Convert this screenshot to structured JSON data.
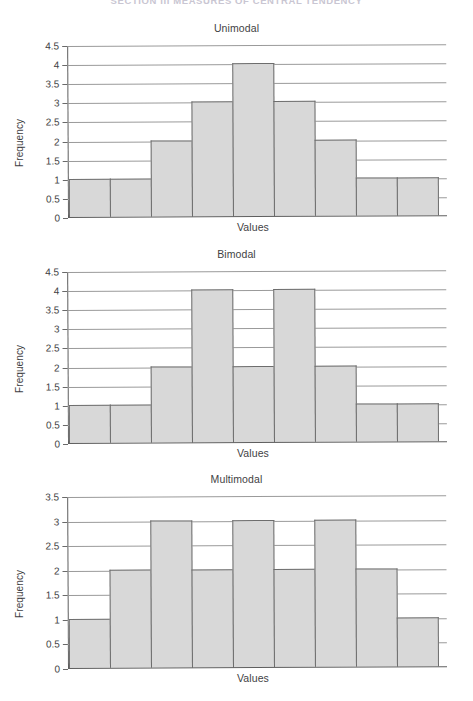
{
  "page": {
    "running_head": "SECTION III MEASURES OF CENTRAL TENDENCY"
  },
  "figures": [
    {
      "title": "Unimodal",
      "xlabel": "Values",
      "ylabel": "Frequency"
    },
    {
      "title": "Bimodal",
      "xlabel": "Values",
      "ylabel": "Frequency"
    },
    {
      "title": "Multimodal",
      "xlabel": "Values",
      "ylabel": "Frequency"
    }
  ],
  "colors": {
    "bar_fill": "#d8d8d8",
    "bar_stroke": "#6d6d6d",
    "gridline": "#9a9a9a",
    "axis": "#5e5e5e",
    "text": "#3f3f44",
    "running_head": "#c9c6d2"
  },
  "chart_data": [
    {
      "type": "bar",
      "title": "Unimodal",
      "xlabel": "Values",
      "ylabel": "Frequency",
      "categories": [
        "1",
        "2",
        "3",
        "4",
        "5",
        "6",
        "7",
        "8",
        "9"
      ],
      "values": [
        1,
        1,
        2,
        3,
        4,
        3,
        2,
        1,
        1
      ],
      "ylim": [
        0,
        4.5
      ],
      "ytick_labels": [
        "0",
        "0.5",
        "1",
        "1.5",
        "2",
        "2.5",
        "3",
        "3.5",
        "4",
        "4.5"
      ],
      "yticks": [
        0,
        0.5,
        1,
        1.5,
        2,
        2.5,
        3,
        3.5,
        4,
        4.5
      ],
      "xtick_labels": [],
      "grid": true,
      "legend": "none"
    },
    {
      "type": "bar",
      "title": "Bimodal",
      "xlabel": "Values",
      "ylabel": "Frequency",
      "categories": [
        "1",
        "2",
        "3",
        "4",
        "5",
        "6",
        "7",
        "8",
        "9"
      ],
      "values": [
        1,
        1,
        2,
        4,
        2,
        4,
        2,
        1,
        1
      ],
      "ylim": [
        0,
        4.5
      ],
      "ytick_labels": [
        "0",
        "0.5",
        "1",
        "1.5",
        "2",
        "2.5",
        "3",
        "3.5",
        "4",
        "4.5"
      ],
      "yticks": [
        0,
        0.5,
        1,
        1.5,
        2,
        2.5,
        3,
        3.5,
        4,
        4.5
      ],
      "xtick_labels": [],
      "grid": true,
      "legend": "none"
    },
    {
      "type": "bar",
      "title": "Multimodal",
      "xlabel": "Values",
      "ylabel": "Frequency",
      "categories": [
        "1",
        "2",
        "3",
        "4",
        "5",
        "6",
        "7",
        "8",
        "9"
      ],
      "values": [
        1,
        2,
        3,
        2,
        3,
        2,
        3,
        2,
        1
      ],
      "ylim": [
        0,
        3.5
      ],
      "ytick_labels": [
        "0",
        "0.5",
        "1",
        "1.5",
        "2",
        "2.5",
        "3",
        "3.5"
      ],
      "yticks": [
        0,
        0.5,
        1,
        1.5,
        2,
        2.5,
        3,
        3.5
      ],
      "xtick_labels": [],
      "grid": true,
      "legend": "none"
    }
  ]
}
